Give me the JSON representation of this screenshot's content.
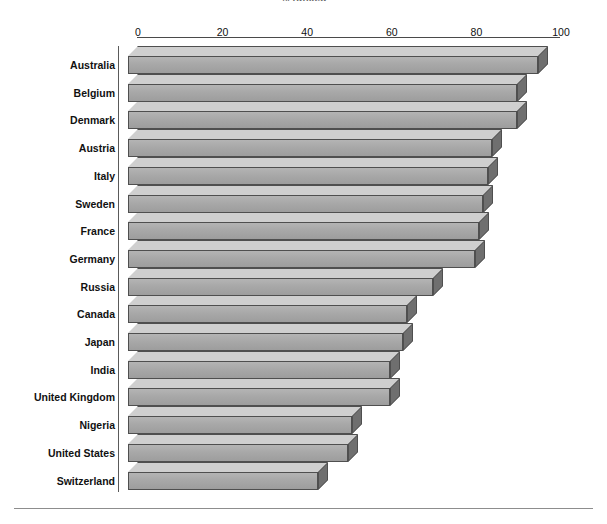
{
  "chart_data": {
    "type": "bar",
    "orientation": "horizontal",
    "title": "% ranked",
    "xlabel": "",
    "ylabel": "",
    "xlim": [
      0,
      100
    ],
    "xticks": [
      0,
      20,
      40,
      60,
      80,
      100
    ],
    "xtick_labels": [
      "0",
      "20",
      "40",
      "60",
      "80",
      "100"
    ],
    "grid": false,
    "legend": false,
    "bar_style": "3d",
    "bar_color": "#a8a8a8",
    "bar_top_color": "#cfcfcf",
    "bar_side_color": "#6f6f6f",
    "bar_edge_color": "#4f4f4f",
    "categories": [
      "Australia",
      "Belgium",
      "Denmark",
      "Austria",
      "Italy",
      "Sweden",
      "France",
      "Germany",
      "Russia",
      "Canada",
      "Japan",
      "India",
      "United Kingdom",
      "Nigeria",
      "United States",
      "Switzerland"
    ],
    "values": [
      97,
      92,
      92,
      86,
      85,
      84,
      83,
      82,
      72,
      66,
      65,
      62,
      62,
      53,
      52,
      45
    ]
  },
  "axis": {
    "ticks": [
      {
        "label": "0",
        "value": 0
      },
      {
        "label": "20",
        "value": 20
      },
      {
        "label": "40",
        "value": 40
      },
      {
        "label": "60",
        "value": 60
      },
      {
        "label": "80",
        "value": 80
      },
      {
        "label": "100",
        "value": 100
      }
    ]
  }
}
